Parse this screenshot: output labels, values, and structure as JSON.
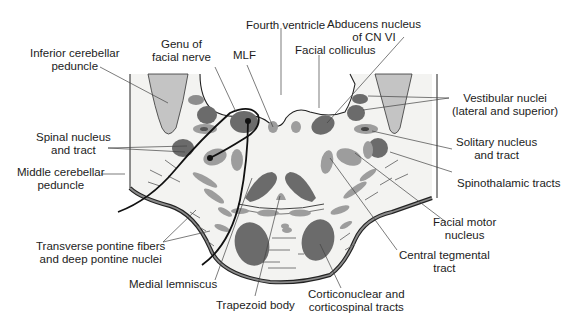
{
  "figure": {
    "colors": {
      "background": "#ffffff",
      "tissue": "#f3f3f1",
      "dark_gray_nucleus": "#6b6b6b",
      "light_gray_nucleus": "#9d9d9d",
      "peduncle_fill": "#c4c4c4",
      "outline": "#222222",
      "leader": "#444444"
    }
  },
  "labels": {
    "fourth_ventricle": "Fourth ventricle",
    "genu_facial_nerve_1": "Genu of",
    "genu_facial_nerve_2": "facial nerve",
    "mlf": "MLF",
    "facial_colliculus": "Facial colliculus",
    "abducens_1": "Abducens nucleus",
    "abducens_2": "of CN VI",
    "inferior_cerebellar_1": "Inferior cerebellar",
    "inferior_cerebellar_2": "peduncle",
    "vestibular_1": "Vestibular nuclei",
    "vestibular_2": "(lateral and superior)",
    "spinal_nucleus_1": "Spinal nucleus",
    "spinal_nucleus_2": "and tract",
    "solitary_1": "Solitary nucleus",
    "solitary_2": "and tract",
    "middle_cerebellar_1": "Middle cerebellar",
    "middle_cerebellar_2": "peduncle",
    "spinothalamic": "Spinothalamic tracts",
    "facial_motor_1": "Facial motor",
    "facial_motor_2": "nucleus",
    "transverse_1": "Transverse pontine fibers",
    "transverse_2": "and deep pontine nuclei",
    "central_tegmental_1": "Central tegmental",
    "central_tegmental_2": "tract",
    "medial_lemniscus": "Medial lemniscus",
    "trapezoid_body": "Trapezoid body",
    "corticonuclear_1": "Corticonuclear and",
    "corticonuclear_2": "corticospinal tracts"
  }
}
